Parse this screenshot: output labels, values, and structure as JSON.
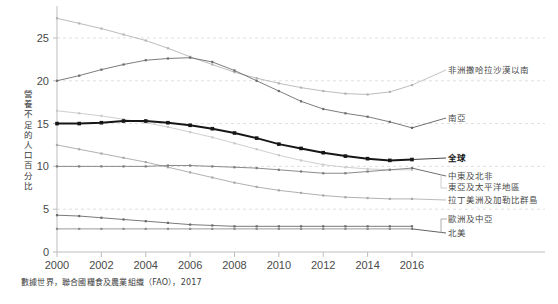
{
  "footer": {
    "source": "數據世界，聯合國糧食及農業組織（FAO），2017"
  },
  "axis": {
    "ylabel": "營養不足的人口百分比",
    "yticks": [
      "0",
      "5",
      "10",
      "15",
      "20",
      "25"
    ],
    "xticks": [
      "2000",
      "2002",
      "2004",
      "2006",
      "2008",
      "2010",
      "2012",
      "2014",
      "2016"
    ]
  },
  "labels": {
    "sub_saharan_africa": "非洲撒哈拉沙漠以南",
    "south_asia": "南亞",
    "world": "全球",
    "mena": "中東及北非",
    "east_asia_pacific": "東亞及太平洋地區",
    "latin_america_caribbean": "拉丁美洲及加勒比群島",
    "europe_central_asia": "歐洲及中亞",
    "north_america": "北美"
  },
  "colors": {
    "world": "#161616",
    "sub_saharan_africa": "#b4b4b4",
    "south_asia": "#6d6d6d",
    "mena": "#7d7d7d",
    "east_asia_pacific": "#c9c9c9",
    "latin_america_caribbean": "#a8a8a8",
    "europe_central_asia": "#6a6a6a",
    "north_america": "#8f8f8f",
    "grid": "#e2dede",
    "axis": "#bdbdbd"
  },
  "chart_data": {
    "type": "line",
    "title": "",
    "xlabel": "",
    "ylabel": "營養不足的人口百分比",
    "xlim": [
      2000,
      2016
    ],
    "ylim": [
      0,
      28.5
    ],
    "grid": true,
    "legend": "right-inline-labels",
    "x": [
      2000,
      2001,
      2002,
      2003,
      2004,
      2005,
      2006,
      2007,
      2008,
      2009,
      2010,
      2011,
      2012,
      2013,
      2014,
      2015,
      2016
    ],
    "series": [
      {
        "name": "非洲撒哈拉沙漠以南",
        "values": [
          27.3,
          26.7,
          26.1,
          25.4,
          24.7,
          23.8,
          22.8,
          21.9,
          21.0,
          20.3,
          19.7,
          19.2,
          18.8,
          18.5,
          18.4,
          18.7,
          19.5
        ]
      },
      {
        "name": "南亞",
        "values": [
          20.0,
          20.6,
          21.3,
          21.9,
          22.4,
          22.6,
          22.7,
          22.2,
          21.2,
          20.0,
          18.8,
          17.6,
          16.7,
          16.2,
          15.8,
          15.2,
          14.5
        ]
      },
      {
        "name": "全球",
        "values": [
          15.0,
          15.0,
          15.1,
          15.3,
          15.3,
          15.1,
          14.8,
          14.4,
          13.9,
          13.3,
          12.6,
          12.1,
          11.6,
          11.2,
          10.9,
          10.7,
          10.8
        ]
      },
      {
        "name": "東亞及太平洋地區",
        "values": [
          16.5,
          16.2,
          15.9,
          15.5,
          15.1,
          14.6,
          14.0,
          13.4,
          12.7,
          12.0,
          11.3,
          10.7,
          10.2,
          9.9,
          9.7,
          9.6,
          9.6
        ]
      },
      {
        "name": "中東及北非",
        "values": [
          10.0,
          10.0,
          10.0,
          10.0,
          10.0,
          10.1,
          10.1,
          10.0,
          9.9,
          9.8,
          9.6,
          9.4,
          9.2,
          9.2,
          9.4,
          9.6,
          9.8
        ]
      },
      {
        "name": "拉丁美洲及加勒比群島",
        "values": [
          12.5,
          12.0,
          11.5,
          11.0,
          10.5,
          9.9,
          9.3,
          8.7,
          8.1,
          7.6,
          7.2,
          6.9,
          6.6,
          6.4,
          6.3,
          6.2,
          6.2
        ]
      },
      {
        "name": "歐洲及中亞",
        "values": [
          4.3,
          4.2,
          4.0,
          3.8,
          3.6,
          3.4,
          3.2,
          3.1,
          3.0,
          3.0,
          3.0,
          3.0,
          3.0,
          3.0,
          3.0,
          3.0,
          3.0
        ]
      },
      {
        "name": "北美",
        "values": [
          2.7,
          2.7,
          2.7,
          2.7,
          2.7,
          2.7,
          2.7,
          2.7,
          2.7,
          2.7,
          2.7,
          2.7,
          2.7,
          2.7,
          2.7,
          2.7,
          2.7
        ]
      }
    ]
  }
}
